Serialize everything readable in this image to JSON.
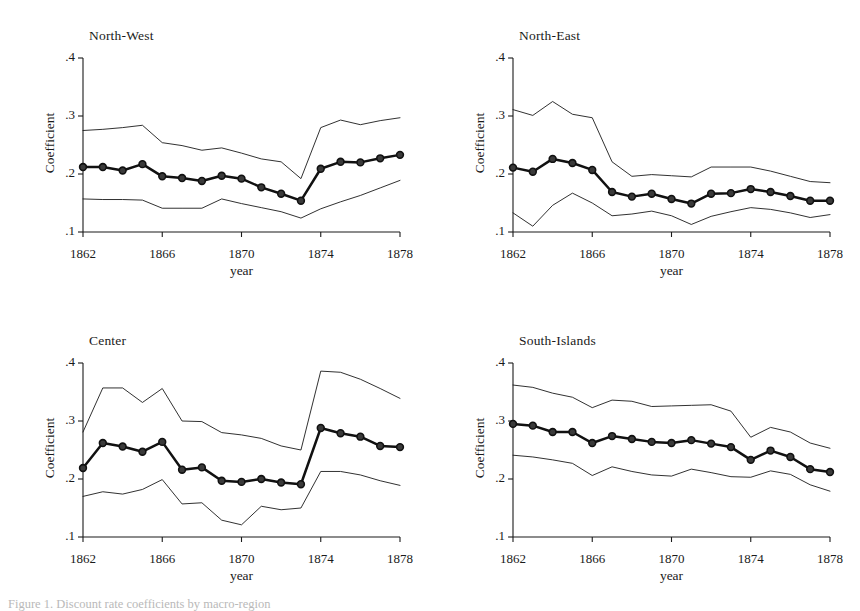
{
  "figure": {
    "caption": "Figure 1. Discount rate coefficients by macro-region",
    "panel_count": 4
  },
  "axes": {
    "ylabel": "Coefficient",
    "xlabel": "year",
    "yticks": [
      ".1",
      ".2",
      ".3",
      ".4"
    ],
    "ytick_values": [
      0.1,
      0.2,
      0.3,
      0.4
    ],
    "xticks": [
      "1862",
      "1866",
      "1870",
      "1874",
      "1878"
    ],
    "xtick_values": [
      1862,
      1866,
      1870,
      1874,
      1878
    ],
    "ylim": [
      0.1,
      0.4
    ],
    "xlim": [
      1862,
      1878
    ],
    "grid": false,
    "legend": "none"
  },
  "colors": {
    "line": "#111111",
    "ci": "#1a1a1a",
    "marker_fill": "#3a3a3a",
    "axis": "#1a1a1a",
    "background": "#ffffff"
  },
  "chart_data": [
    {
      "type": "line",
      "title": "North-West",
      "xlabel": "year",
      "ylabel": "Coefficient",
      "ylim": [
        0.1,
        0.4
      ],
      "xlim": [
        1862,
        1878
      ],
      "grid": false,
      "x": [
        1862,
        1863,
        1864,
        1865,
        1866,
        1867,
        1868,
        1869,
        1870,
        1871,
        1872,
        1873,
        1874,
        1875,
        1876,
        1877,
        1878
      ],
      "series": [
        {
          "name": "Coefficient",
          "values": [
            0.212,
            0.212,
            0.206,
            0.217,
            0.196,
            0.193,
            0.188,
            0.197,
            0.192,
            0.177,
            0.166,
            0.154,
            0.209,
            0.221,
            0.22,
            0.227,
            0.233
          ]
        },
        {
          "name": "CI upper",
          "values": [
            0.275,
            0.277,
            0.28,
            0.284,
            0.254,
            0.249,
            0.241,
            0.245,
            0.236,
            0.226,
            0.221,
            0.192,
            0.28,
            0.293,
            0.285,
            0.292,
            0.297
          ]
        },
        {
          "name": "CI lower",
          "values": [
            0.157,
            0.156,
            0.156,
            0.155,
            0.141,
            0.141,
            0.141,
            0.157,
            0.149,
            0.142,
            0.135,
            0.124,
            0.14,
            0.152,
            0.163,
            0.176,
            0.189
          ]
        }
      ]
    },
    {
      "type": "line",
      "title": "North-East",
      "xlabel": "year",
      "ylabel": "Coefficient",
      "ylim": [
        0.1,
        0.4
      ],
      "xlim": [
        1862,
        1878
      ],
      "grid": false,
      "x": [
        1862,
        1863,
        1864,
        1865,
        1866,
        1867,
        1868,
        1869,
        1870,
        1871,
        1872,
        1873,
        1874,
        1875,
        1876,
        1877,
        1878
      ],
      "series": [
        {
          "name": "Coefficient",
          "values": [
            0.211,
            0.204,
            0.226,
            0.219,
            0.207,
            0.169,
            0.161,
            0.166,
            0.157,
            0.149,
            0.166,
            0.167,
            0.174,
            0.169,
            0.162,
            0.154,
            0.154
          ]
        },
        {
          "name": "CI upper",
          "values": [
            0.311,
            0.301,
            0.325,
            0.303,
            0.297,
            0.221,
            0.196,
            0.199,
            0.197,
            0.195,
            0.212,
            0.212,
            0.212,
            0.205,
            0.196,
            0.187,
            0.185
          ]
        },
        {
          "name": "CI lower",
          "values": [
            0.133,
            0.11,
            0.146,
            0.167,
            0.15,
            0.128,
            0.131,
            0.136,
            0.128,
            0.113,
            0.127,
            0.135,
            0.142,
            0.139,
            0.133,
            0.125,
            0.13
          ]
        }
      ]
    },
    {
      "type": "line",
      "title": "Center",
      "xlabel": "year",
      "ylabel": "Coefficient",
      "ylim": [
        0.1,
        0.4
      ],
      "xlim": [
        1862,
        1878
      ],
      "grid": false,
      "x": [
        1862,
        1863,
        1864,
        1865,
        1866,
        1867,
        1868,
        1869,
        1870,
        1871,
        1872,
        1873,
        1874,
        1875,
        1876,
        1877,
        1878
      ],
      "series": [
        {
          "name": "Coefficient",
          "values": [
            0.219,
            0.262,
            0.256,
            0.247,
            0.264,
            0.216,
            0.22,
            0.197,
            0.195,
            0.2,
            0.194,
            0.191,
            0.288,
            0.279,
            0.273,
            0.257,
            0.255
          ]
        },
        {
          "name": "CI upper",
          "values": [
            0.281,
            0.357,
            0.357,
            0.332,
            0.356,
            0.3,
            0.299,
            0.28,
            0.276,
            0.27,
            0.257,
            0.25,
            0.386,
            0.384,
            0.372,
            0.356,
            0.339
          ]
        },
        {
          "name": "CI lower",
          "values": [
            0.17,
            0.178,
            0.174,
            0.182,
            0.199,
            0.157,
            0.159,
            0.129,
            0.121,
            0.153,
            0.147,
            0.15,
            0.213,
            0.213,
            0.207,
            0.197,
            0.189
          ]
        }
      ]
    },
    {
      "type": "line",
      "title": "South-Islands",
      "xlabel": "year",
      "ylabel": "Coefficient",
      "ylim": [
        0.1,
        0.4
      ],
      "xlim": [
        1862,
        1878
      ],
      "grid": false,
      "x": [
        1862,
        1863,
        1864,
        1865,
        1866,
        1867,
        1868,
        1869,
        1870,
        1871,
        1872,
        1873,
        1874,
        1875,
        1876,
        1877,
        1878
      ],
      "series": [
        {
          "name": "Coefficient",
          "values": [
            0.295,
            0.292,
            0.281,
            0.281,
            0.262,
            0.274,
            0.269,
            0.264,
            0.262,
            0.267,
            0.261,
            0.255,
            0.233,
            0.249,
            0.238,
            0.217,
            0.212
          ]
        },
        {
          "name": "CI upper",
          "values": [
            0.362,
            0.358,
            0.348,
            0.341,
            0.323,
            0.336,
            0.334,
            0.325,
            0.326,
            0.327,
            0.328,
            0.317,
            0.272,
            0.289,
            0.281,
            0.262,
            0.253
          ]
        },
        {
          "name": "CI lower",
          "values": [
            0.241,
            0.238,
            0.233,
            0.227,
            0.206,
            0.221,
            0.213,
            0.207,
            0.205,
            0.217,
            0.211,
            0.204,
            0.203,
            0.214,
            0.208,
            0.19,
            0.179
          ]
        }
      ]
    }
  ]
}
